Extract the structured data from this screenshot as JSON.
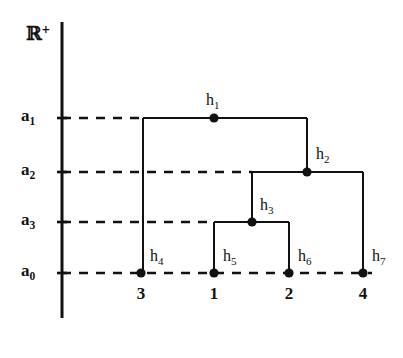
{
  "figure": {
    "kind": "dendrogram",
    "background_color": "#ffffff",
    "ink_color": "#111111",
    "width": 403,
    "height": 358
  },
  "axis": {
    "name": "ℝ",
    "superscript": "+",
    "x": 62,
    "y_top": 22,
    "y_bottom": 318,
    "label_x": 26,
    "label_y": 24
  },
  "levels": [
    {
      "id": "a1",
      "label": "a",
      "sub": "1",
      "y": 118,
      "dash_end_x": 143,
      "label_x": 21,
      "label_y": 107
    },
    {
      "id": "a2",
      "label": "a",
      "sub": "2",
      "y": 172,
      "dash_end_x": 252,
      "label_x": 21,
      "label_y": 161
    },
    {
      "id": "a3",
      "label": "a",
      "sub": "3",
      "y": 222,
      "dash_end_x": 214,
      "label_x": 21,
      "label_y": 211
    },
    {
      "id": "a0",
      "label": "a",
      "sub": "0",
      "y": 273,
      "dash_end_x": 372,
      "label_x": 21,
      "label_y": 262
    }
  ],
  "leaves": [
    {
      "node": "h",
      "sub": "4",
      "label": "3",
      "x": 141,
      "y": 273,
      "label_x": 141,
      "label_y": 285,
      "node_label_x": 150,
      "node_label_y": 248
    },
    {
      "node": "h",
      "sub": "5",
      "label": "1",
      "x": 214,
      "y": 273,
      "label_x": 214,
      "label_y": 285,
      "node_label_x": 223,
      "node_label_y": 248
    },
    {
      "node": "h",
      "sub": "6",
      "label": "2",
      "x": 289,
      "y": 273,
      "label_x": 289,
      "label_y": 285,
      "node_label_x": 298,
      "node_label_y": 248
    },
    {
      "node": "h",
      "sub": "7",
      "label": "4",
      "x": 363,
      "y": 273,
      "label_x": 363,
      "label_y": 285,
      "node_label_x": 372,
      "node_label_y": 248
    }
  ],
  "internal_nodes": [
    {
      "node": "h",
      "sub": "1",
      "x": 214,
      "y": 118,
      "left_x": 143,
      "right_x": 307,
      "label_x": 206,
      "label_y": 92
    },
    {
      "node": "h",
      "sub": "2",
      "x": 307,
      "y": 172,
      "left_x": 252,
      "right_x": 363,
      "label_x": 316,
      "label_y": 146
    },
    {
      "node": "h",
      "sub": "3",
      "x": 252,
      "y": 222,
      "left_x": 214,
      "right_x": 289,
      "label_x": 260,
      "label_y": 197
    }
  ],
  "branches": [
    {
      "from": "h1",
      "to": "h4",
      "x": 143,
      "y_top": 118,
      "y_bottom": 273
    },
    {
      "from": "h1",
      "to": "h2",
      "x": 307,
      "y_top": 118,
      "y_bottom": 172
    },
    {
      "from": "h2",
      "to": "h3",
      "x": 252,
      "y_top": 172,
      "y_bottom": 222
    },
    {
      "from": "h2",
      "to": "h7",
      "x": 363,
      "y_top": 172,
      "y_bottom": 273
    },
    {
      "from": "h3",
      "to": "h5",
      "x": 214,
      "y_top": 222,
      "y_bottom": 273
    },
    {
      "from": "h3",
      "to": "h6",
      "x": 289,
      "y_top": 222,
      "y_bottom": 273
    }
  ],
  "chart_data": {
    "type": "dendrogram",
    "title": "",
    "xlabel": "",
    "ylabel": "ℝ+",
    "leaf_order": [
      "3",
      "1",
      "2",
      "4"
    ],
    "leaf_nodes": [
      "h4",
      "h5",
      "h6",
      "h7"
    ],
    "merge_levels": [
      "a0",
      "a3",
      "a2",
      "a1"
    ],
    "merges": [
      {
        "node": "h3",
        "level": "a3",
        "children": [
          "h5",
          "h6"
        ],
        "leaves": [
          "1",
          "2"
        ]
      },
      {
        "node": "h2",
        "level": "a2",
        "children": [
          "h3",
          "h7"
        ],
        "leaves": [
          "1",
          "2",
          "4"
        ]
      },
      {
        "node": "h1",
        "level": "a1",
        "children": [
          "h4",
          "h2"
        ],
        "leaves": [
          "3",
          "1",
          "2",
          "4"
        ]
      }
    ],
    "level_order_top_to_bottom": [
      "a1",
      "a2",
      "a3",
      "a0"
    ],
    "grid": true,
    "legend": "none"
  }
}
